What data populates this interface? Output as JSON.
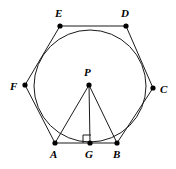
{
  "figure": {
    "background_color": "#ffffff",
    "stroke_color": "#1a1a1a",
    "point_color": "#000000",
    "label_color": "#000000"
  },
  "geometry": {
    "polygon": {
      "name": "hexagon-ABCDEF",
      "sides": 6,
      "vertex_order": [
        "A",
        "B",
        "C",
        "D",
        "E",
        "F"
      ],
      "path": "55,143 117,143 153,88 126,26 60,26 25,85"
    },
    "circle": {
      "name": "inscribed-circle",
      "center_label": "P",
      "cx": 90,
      "cy": 86,
      "r": 56
    },
    "center_point": {
      "label": "P",
      "x": 89,
      "y": 85
    },
    "foot_point": {
      "label": "G",
      "x": 90,
      "y": 143
    },
    "right_angle": {
      "at": "G",
      "marker_path": "83,143 83,135 91,135",
      "measure_degrees": 90
    },
    "segments": [
      {
        "name": "segment-PA",
        "from": "P",
        "to": "A",
        "x1": 89,
        "y1": 85,
        "x2": 55,
        "y2": 143
      },
      {
        "name": "segment-PB",
        "from": "P",
        "to": "B",
        "x1": 89,
        "y1": 85,
        "x2": 117,
        "y2": 143
      },
      {
        "name": "segment-PG",
        "from": "P",
        "to": "G",
        "x1": 89,
        "y1": 85,
        "x2": 90,
        "y2": 143
      }
    ],
    "vertices": [
      {
        "label": "A",
        "x": 55,
        "y": 143,
        "label_x": 50,
        "label_y": 158
      },
      {
        "label": "B",
        "x": 117,
        "y": 143,
        "label_x": 113,
        "label_y": 158
      },
      {
        "label": "C",
        "x": 153,
        "y": 88,
        "label_x": 160,
        "label_y": 93
      },
      {
        "label": "D",
        "x": 126,
        "y": 26,
        "label_x": 123,
        "label_y": 17
      },
      {
        "label": "E",
        "x": 60,
        "y": 26,
        "label_x": 55,
        "label_y": 17
      },
      {
        "label": "F",
        "x": 25,
        "y": 85,
        "label_x": 12,
        "label_y": 90
      }
    ]
  }
}
